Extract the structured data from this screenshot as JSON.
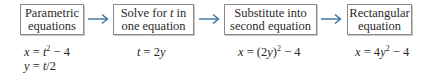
{
  "diagram": {
    "accent_color": "#3a6f9a",
    "steps": [
      {
        "line1": "Parametric",
        "line2": "equations"
      },
      {
        "line1": "Solve for t in",
        "line2": "one equation"
      },
      {
        "line1": "Substitute into",
        "line2": "second equation"
      },
      {
        "line1": "Rectangular",
        "line2": "equation"
      }
    ],
    "formulas": [
      [
        "x = t² − 4",
        "y = t/2"
      ],
      [
        "t = 2y"
      ],
      [
        "x = (2y)² − 4"
      ],
      [
        "x = 4y² − 4"
      ]
    ],
    "arrows": [
      "right-arrow",
      "right-arrow",
      "right-arrow"
    ]
  }
}
